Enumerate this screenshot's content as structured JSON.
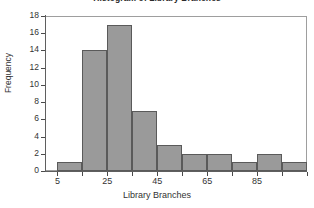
{
  "chart_data": {
    "type": "bar",
    "title": "Histogram of Library Branches",
    "xlabel": "Library Branches",
    "ylabel": "Frequency",
    "categories": [
      "5-15",
      "15-25",
      "25-35",
      "35-45",
      "45-55",
      "55-65",
      "65-75",
      "75-85",
      "85-95",
      "95-105"
    ],
    "bin_starts": [
      5,
      15,
      25,
      35,
      45,
      55,
      65,
      75,
      85,
      95
    ],
    "bin_width": 10,
    "values": [
      1,
      14,
      17,
      7,
      3,
      2,
      2,
      1,
      2,
      1
    ],
    "xlim": [
      0,
      105
    ],
    "ylim": [
      0,
      18
    ],
    "x_ticks": [
      5,
      25,
      45,
      65,
      85
    ],
    "x_tick_labels": [
      "5",
      "25",
      "45",
      "65",
      "85"
    ],
    "y_ticks": [
      0,
      2,
      4,
      6,
      8,
      10,
      12,
      14,
      16,
      18
    ],
    "y_tick_labels": [
      "0",
      "2",
      "4",
      "6",
      "8",
      "10",
      "12",
      "14",
      "16",
      "18"
    ],
    "grid": false,
    "legend": false,
    "bar_color": "#9a9a9a",
    "bar_edge_color": "#5a5a5a",
    "axis_color": "#5f5f5f",
    "frame_color": "#9e9e9e",
    "background": "#ffffff"
  }
}
